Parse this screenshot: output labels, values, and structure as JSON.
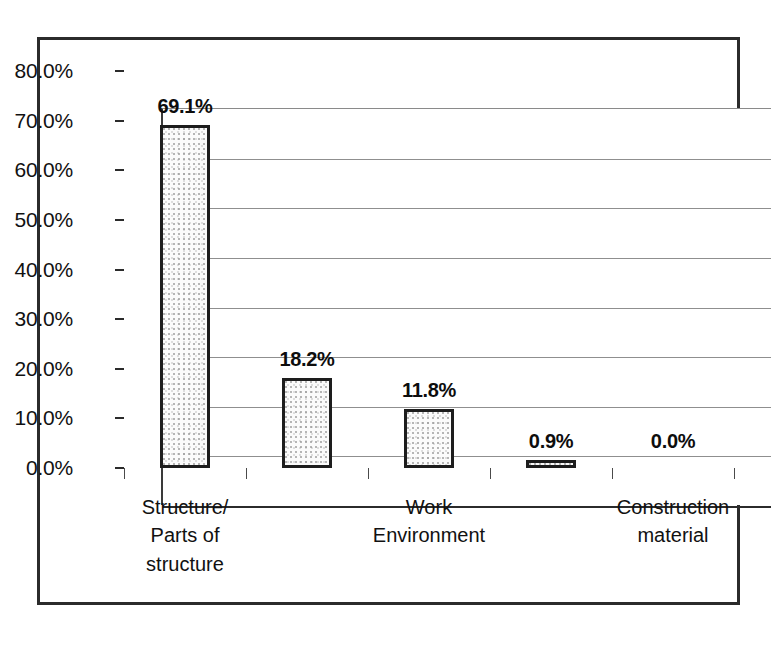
{
  "chart_data": {
    "type": "bar",
    "title": "",
    "subtitle": "",
    "xlabel": "",
    "ylabel": "",
    "categories": [
      "Structure/\nParts of\nstructure",
      "",
      "Work\nEnvironment",
      "",
      "Construction\nmaterial"
    ],
    "category_lines": [
      [
        "Structure/",
        "Parts of",
        "structure"
      ],
      [],
      [
        "Work",
        "Environment"
      ],
      [],
      [
        "Construction",
        "material"
      ]
    ],
    "values": [
      69.1,
      18.2,
      11.8,
      0.9,
      0.0
    ],
    "value_labels": [
      "69.1%",
      "18.2%",
      "11.8%",
      "0.9%",
      "0.0%"
    ],
    "ylim": [
      0,
      80
    ],
    "ytick_values": [
      0,
      10,
      20,
      30,
      40,
      50,
      60,
      70,
      80
    ],
    "ytick_labels": [
      "0.0%",
      "10.0%",
      "20.0%",
      "30.0%",
      "40.0%",
      "50.0%",
      "60.0%",
      "70.0%",
      "80.0%"
    ],
    "grid": true,
    "grid_axis": "y",
    "legend": false,
    "legend_position": "none",
    "bar_fill_color": "#fbfbfb",
    "bar_border_color": "#1d1d1d",
    "gridline_color": "#8f8f8f",
    "axis_color": "#2b2b2b",
    "frame_color": "#2b2b2b",
    "background_color": "#ffffff",
    "data_labels_shown": true,
    "units": "percent"
  }
}
